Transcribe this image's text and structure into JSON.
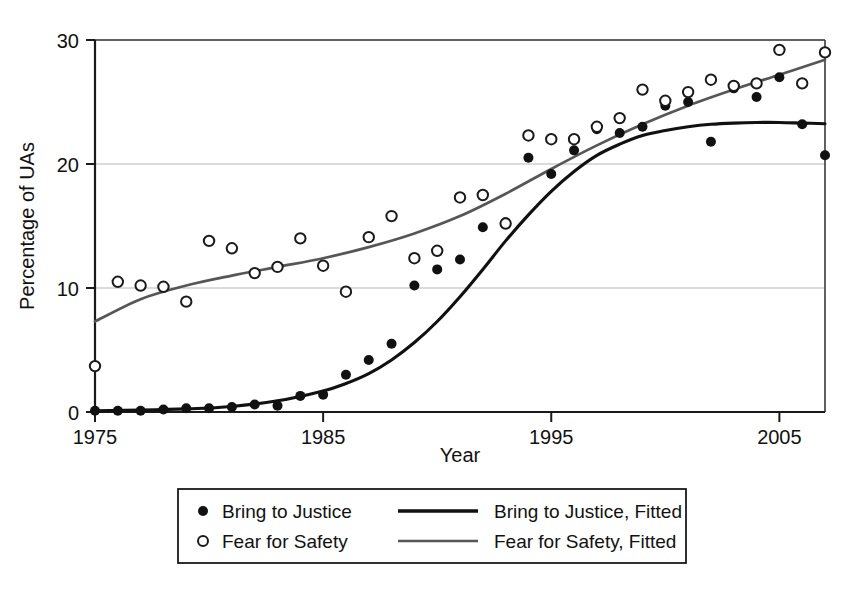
{
  "chart_data": {
    "type": "scatter",
    "title": "",
    "xlabel": "Year",
    "ylabel": "Percentage of UAs",
    "xlim": [
      1975,
      2007
    ],
    "ylim": [
      0,
      30
    ],
    "xticks": [
      1975,
      1985,
      1995,
      2005
    ],
    "xtick_labels": [
      "1975",
      "1985",
      "1995",
      "2005"
    ],
    "yticks": [
      0,
      10,
      20,
      30
    ],
    "ytick_labels": [
      "0",
      "10",
      "20",
      "30"
    ],
    "grid": "horizontal",
    "legend_position": "below-axes",
    "series": [
      {
        "name": "Bring to Justice",
        "marker": "filled-circle",
        "color": "#111111",
        "x": [
          1975,
          1976,
          1977,
          1978,
          1979,
          1980,
          1981,
          1982,
          1983,
          1984,
          1985,
          1986,
          1987,
          1988,
          1989,
          1990,
          1991,
          1992,
          1993,
          1994,
          1995,
          1996,
          1997,
          1998,
          1999,
          2000,
          2001,
          2002,
          2003,
          2004,
          2005,
          2006,
          2007
        ],
        "values": [
          0.1,
          0.1,
          0.1,
          0.2,
          0.3,
          0.3,
          0.4,
          0.6,
          0.5,
          1.3,
          1.4,
          3.0,
          4.2,
          5.5,
          10.2,
          11.5,
          12.3,
          14.9,
          15.3,
          20.5,
          19.2,
          21.1,
          22.8,
          22.5,
          23.0,
          24.7,
          25.0,
          21.8,
          26.1,
          25.4,
          27.0,
          23.2,
          20.7
        ]
      },
      {
        "name": "Fear for Safety",
        "marker": "open-circle",
        "color": "#1a1a1a",
        "x": [
          1975,
          1976,
          1977,
          1978,
          1979,
          1980,
          1981,
          1982,
          1983,
          1984,
          1985,
          1986,
          1987,
          1988,
          1989,
          1990,
          1991,
          1992,
          1993,
          1994,
          1995,
          1996,
          1997,
          1998,
          1999,
          2000,
          2001,
          2002,
          2003,
          2004,
          2005,
          2006,
          2007
        ],
        "values": [
          3.7,
          10.5,
          10.2,
          10.1,
          8.9,
          13.8,
          13.2,
          11.2,
          11.7,
          14.0,
          11.8,
          9.7,
          14.1,
          15.8,
          12.4,
          13.0,
          17.3,
          17.5,
          15.2,
          22.3,
          22.0,
          22.0,
          23.0,
          23.7,
          26.0,
          25.1,
          25.8,
          26.8,
          26.3,
          26.5,
          29.2,
          26.5,
          29.0
        ]
      }
    ],
    "fitted_curves": [
      {
        "name": "Bring to Justice, Fitted",
        "color": "#111111",
        "x": [
          1975,
          1977,
          1979,
          1981,
          1983,
          1985,
          1986,
          1987,
          1988,
          1989,
          1990,
          1991,
          1992,
          1993,
          1994,
          1995,
          1996,
          1997,
          1998,
          1999,
          2000,
          2001,
          2002,
          2003,
          2004,
          2005,
          2006,
          2007
        ],
        "values": [
          0.1,
          0.15,
          0.25,
          0.45,
          0.9,
          1.7,
          2.3,
          3.1,
          4.2,
          5.6,
          7.3,
          9.3,
          11.5,
          13.8,
          15.9,
          17.8,
          19.4,
          20.7,
          21.6,
          22.3,
          22.7,
          23.0,
          23.2,
          23.3,
          23.35,
          23.35,
          23.3,
          23.25
        ]
      },
      {
        "name": "Fear for Safety, Fitted",
        "color": "#565656",
        "x": [
          1975,
          1977,
          1979,
          1981,
          1983,
          1985,
          1987,
          1989,
          1991,
          1993,
          1995,
          1997,
          1999,
          2001,
          2003,
          2005,
          2007
        ],
        "values": [
          7.3,
          9.1,
          10.2,
          11.0,
          11.7,
          12.4,
          13.3,
          14.4,
          15.8,
          17.6,
          19.6,
          21.5,
          23.2,
          24.7,
          26.0,
          27.2,
          28.4
        ]
      }
    ]
  },
  "legend": {
    "entries": [
      {
        "label": "Bring to Justice",
        "marker": "filled-circle"
      },
      {
        "label": "Fear for Safety",
        "marker": "open-circle"
      },
      {
        "label": "Bring to Justice, Fitted",
        "marker": "solid-line-dark"
      },
      {
        "label": "Fear for Safety, Fitted",
        "marker": "solid-line-gray"
      }
    ]
  },
  "colors": {
    "justice": "#111111",
    "safety": "#565656",
    "grid": "#cfcfcf",
    "axis": "#1a1a1a",
    "background": "#ffffff"
  }
}
